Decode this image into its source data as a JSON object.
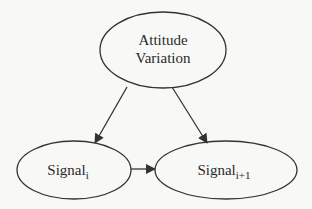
{
  "diagram": {
    "type": "directed-graph",
    "nodes": [
      {
        "id": "attitude",
        "label_line1": "Attitude",
        "label_line2": "Variation"
      },
      {
        "id": "signal_i",
        "label": "Signal",
        "subscript": "i"
      },
      {
        "id": "signal_i1",
        "label": "Signal",
        "subscript": "i+1"
      }
    ],
    "edges": [
      {
        "from": "attitude",
        "to": "signal_i"
      },
      {
        "from": "attitude",
        "to": "signal_i1"
      },
      {
        "from": "signal_i",
        "to": "signal_i1"
      }
    ],
    "colors": {
      "stroke": "#333333",
      "background": "#f8f8f6",
      "text": "#2a2a2a"
    }
  }
}
